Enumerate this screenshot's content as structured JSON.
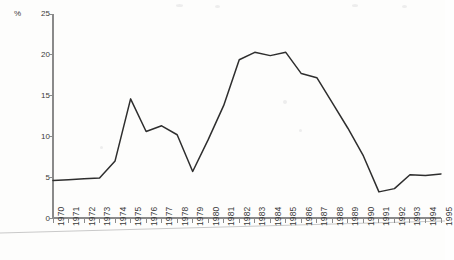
{
  "chart_data": {
    "type": "line",
    "title": "",
    "subtitle": "",
    "xlabel": "",
    "ylabel": "",
    "unit_label": "%",
    "grid": false,
    "legend": "none",
    "xlim": [
      1970,
      1995
    ],
    "ylim": [
      0,
      25
    ],
    "y_ticks": [
      0,
      5,
      10,
      15,
      20,
      25
    ],
    "y_tick_labels": [
      "0",
      "5",
      "10",
      "15",
      "20",
      "25"
    ],
    "categories": [
      "1970",
      "1971",
      "1972",
      "1973",
      "1974",
      "1975",
      "1976",
      "1977",
      "1978",
      "1979",
      "1980",
      "1981",
      "1982",
      "1983",
      "1984",
      "1985",
      "1986",
      "1987",
      "1988",
      "1989",
      "1990",
      "1991",
      "1992",
      "1993",
      "1994",
      "1995"
    ],
    "x": [
      1970,
      1971,
      1972,
      1973,
      1974,
      1975,
      1976,
      1977,
      1978,
      1979,
      1980,
      1981,
      1982,
      1983,
      1984,
      1985,
      1986,
      1987,
      1988,
      1989,
      1990,
      1991,
      1992,
      1993,
      1994,
      1995
    ],
    "values": [
      4.6,
      4.7,
      4.8,
      4.9,
      7.0,
      14.6,
      10.6,
      11.3,
      10.2,
      5.7,
      9.6,
      13.8,
      19.4,
      20.3,
      19.9,
      20.3,
      17.7,
      17.2,
      14.1,
      11.0,
      7.6,
      3.2,
      3.6,
      5.3,
      5.2,
      5.4
    ],
    "series": [
      {
        "name": "",
        "color": "#2e2e2e",
        "values": [
          4.6,
          4.7,
          4.8,
          4.9,
          7.0,
          14.6,
          10.6,
          11.3,
          10.2,
          5.7,
          9.6,
          13.8,
          19.4,
          20.3,
          19.9,
          20.3,
          17.7,
          17.2,
          14.1,
          11.0,
          7.6,
          3.2,
          3.6,
          5.3,
          5.2,
          5.4
        ]
      }
    ]
  },
  "colors": {
    "line": "#2e2e2e",
    "axis": "#8a8a8a",
    "text": "#3a3a3a",
    "background": "#fefefe",
    "artifact": "#c9c9c9"
  },
  "axes": {
    "y_unit": "%",
    "y_tick_labels": [
      "25",
      "20",
      "15",
      "10",
      "5",
      "0"
    ],
    "x_tick_labels": [
      "1970",
      "1971",
      "1972",
      "1973",
      "1974",
      "1975",
      "1976",
      "1977",
      "1978",
      "1979",
      "1980",
      "1981",
      "1982",
      "1983",
      "1984",
      "1985",
      "1986",
      "1987",
      "1988",
      "1989",
      "1990",
      "1991",
      "1992",
      "1993",
      "1994",
      "1995"
    ]
  }
}
